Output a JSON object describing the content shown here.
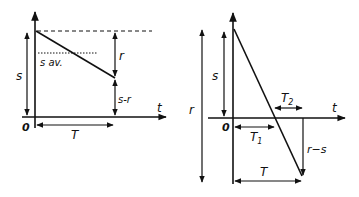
{
  "diagrams": [
    {
      "id": "left",
      "labels": {
        "origin": "0",
        "t_axis": "t",
        "s": "s",
        "s_av": "s av.",
        "r": "r",
        "s_minus_r": "s-r",
        "T": "T"
      }
    },
    {
      "id": "right",
      "labels": {
        "origin": "0",
        "t_axis": "t",
        "r": "r",
        "s": "s",
        "T1": "T",
        "T1_sub": "1",
        "T2": "T",
        "T2_sub": "2",
        "r_minus_s": "r−s",
        "T": "T"
      }
    }
  ],
  "colors": {
    "ink": "#111111",
    "background": "#ffffff"
  }
}
